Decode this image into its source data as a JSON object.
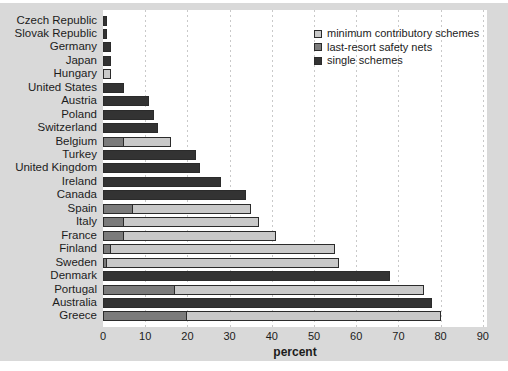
{
  "figure": {
    "panel_background": "#d9d9d9",
    "plot_background": "#ffffff",
    "grid_color": "#c9c9c9",
    "bar_border_color": "#2b2b2b",
    "text_color": "#1c1c1c"
  },
  "chart_data": {
    "type": "bar",
    "orientation": "horizontal",
    "stacked": true,
    "title": "",
    "xlabel": "percent",
    "ylabel": "",
    "xlim": [
      0,
      90
    ],
    "xticks": [
      0,
      10,
      20,
      30,
      40,
      50,
      60,
      70,
      80,
      90
    ],
    "grid": "vertical-dashed",
    "legend_position": "top-right",
    "legend": [
      {
        "label": "minimum contributory schemes",
        "key": "minimum_contributory",
        "color": "#c9c9c9"
      },
      {
        "label": "last-resort safety nets",
        "key": "last_resort",
        "color": "#7b7b7b"
      },
      {
        "label": "single schemes",
        "key": "single",
        "color": "#333333"
      }
    ],
    "stack_order": [
      "single",
      "last_resort",
      "minimum_contributory"
    ],
    "categories": [
      "Czech Republic",
      "Slovak Republic",
      "Germany",
      "Japan",
      "Hungary",
      "United States",
      "Austria",
      "Poland",
      "Switzerland",
      "Belgium",
      "Turkey",
      "United Kingdom",
      "Ireland",
      "Canada",
      "Spain",
      "Italy",
      "France",
      "Finland",
      "Sweden",
      "Denmark",
      "Portugal",
      "Australia",
      "Greece"
    ],
    "series": [
      {
        "name": "single schemes",
        "key": "single",
        "color": "#333333",
        "values": [
          1,
          1,
          2,
          2,
          0,
          5,
          11,
          12,
          13,
          0,
          22,
          23,
          28,
          34,
          0,
          0,
          0,
          0,
          0,
          68,
          0,
          78,
          0
        ]
      },
      {
        "name": "last-resort safety nets",
        "key": "last_resort",
        "color": "#7b7b7b",
        "values": [
          0,
          0,
          0,
          0,
          0,
          0,
          0,
          0,
          0,
          5,
          0,
          0,
          0,
          0,
          7,
          5,
          5,
          2,
          1,
          0,
          17,
          0,
          20
        ]
      },
      {
        "name": "minimum contributory schemes",
        "key": "minimum_contributory",
        "color": "#c9c9c9",
        "values": [
          0,
          0,
          0,
          0,
          2,
          0,
          0,
          0,
          0,
          11,
          0,
          0,
          0,
          0,
          28,
          32,
          36,
          53,
          55,
          0,
          59,
          0,
          60
        ]
      }
    ],
    "totals": [
      1,
      1,
      2,
      2,
      2,
      5,
      11,
      12,
      13,
      16,
      22,
      23,
      28,
      34,
      35,
      37,
      41,
      55,
      56,
      68,
      76,
      78,
      80
    ]
  }
}
